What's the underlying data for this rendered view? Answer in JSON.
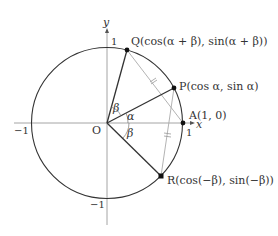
{
  "figure": {
    "axes": {
      "x_label": "x",
      "y_label": "y",
      "origin_label": "O",
      "tick_pos_x": "1",
      "tick_neg_x": "−1",
      "tick_pos_y": "1",
      "tick_neg_y": "−1"
    },
    "points": {
      "Q": "Q(cos(α + β), sin(α + β))",
      "P": "P(cos α, sin α)",
      "A": "A(1, 0)",
      "R": "R(cos(−β), sin(−β))"
    },
    "angles": {
      "beta_upper": "β",
      "alpha": "α",
      "beta_lower": "β"
    },
    "colors": {
      "circle": "#333333",
      "axis": "#999999",
      "radius": "#333333",
      "chord": "#aaaaaa",
      "point": "#111111"
    }
  }
}
